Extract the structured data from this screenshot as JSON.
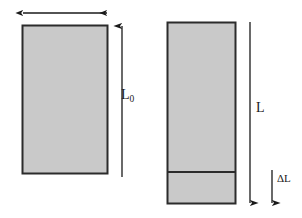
{
  "figure": {
    "background_color": "#ffffff",
    "bar_fill_color": "#c9c9c9",
    "bar_stroke_color": "#2b2b2b",
    "arrow_color": "#1a1a1a",
    "label_color": "#1a1a1a"
  },
  "labels": {
    "width_arrow": "",
    "original_length": "L",
    "original_length_subscript": "0",
    "stretched_length": "L",
    "elongation": "ΔL"
  },
  "shapes": {
    "original_bar": {
      "name": "original bar",
      "x": 22,
      "y": 25,
      "width": 86,
      "height": 149
    },
    "stretched_bar_upper": {
      "name": "stretched bar original portion",
      "x": 167,
      "y": 22,
      "width": 69,
      "height": 150
    },
    "stretched_bar_extension": {
      "name": "stretched bar extension portion",
      "x": 167,
      "y": 172,
      "width": 69,
      "height": 32
    }
  },
  "dimensions": {
    "width_arrow": {
      "name": "width dimension arrow",
      "orientation": "horizontal",
      "heads": "both",
      "x1": 22,
      "x2": 108,
      "y": 13
    },
    "original_length_arrow": {
      "name": "original length dimension arrow",
      "orientation": "vertical",
      "heads": "top",
      "x": 122,
      "y1": 25,
      "y2": 177
    },
    "stretched_length_arrow": {
      "name": "stretched length dimension arrow",
      "orientation": "vertical",
      "heads": "bottom",
      "x": 250,
      "y1": 22,
      "y2": 204
    },
    "elongation_arrow": {
      "name": "elongation dimension arrow",
      "orientation": "vertical",
      "heads": "bottom",
      "x": 272,
      "y1": 170,
      "y2": 204
    }
  }
}
